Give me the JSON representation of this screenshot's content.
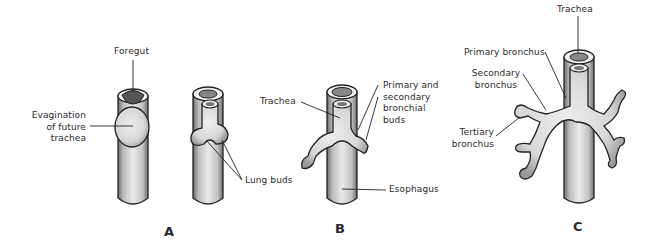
{
  "figure": {
    "panels": [
      {
        "id": "A",
        "label": "A",
        "labels": {
          "foregut": "Foregut",
          "evagination": [
            "Evagination",
            "of future",
            "trachea"
          ],
          "lung_buds": "Lung buds"
        }
      },
      {
        "id": "B",
        "label": "B",
        "labels": {
          "trachea": "Trachea",
          "bronchial_buds": [
            "Primary and",
            "secondary",
            "bronchial",
            "buds"
          ],
          "esophagus": "Esophagus"
        }
      },
      {
        "id": "C",
        "label": "C",
        "labels": {
          "trachea": "Trachea",
          "primary_bronchus": "Primary bronchus",
          "secondary_bronchus": [
            "Secondary",
            "bronchus"
          ],
          "tertiary_bronchus": [
            "Tertiary",
            "bronchus"
          ]
        }
      }
    ],
    "colors": {
      "line": "#2a2a2a",
      "tube_fill": "#e4e4e4",
      "shade": "#8a8a8a"
    }
  }
}
